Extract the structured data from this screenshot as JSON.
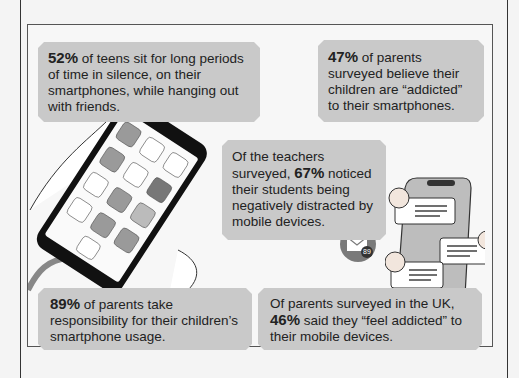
{
  "stats": [
    {
      "id": "teens_silence",
      "pct": "52%",
      "pre": "",
      "post": " of teens sit for long periods of time in silence, on their smartphones, while hanging out with friends."
    },
    {
      "id": "parents_believe_addicted",
      "pct": "47%",
      "pre": "",
      "post": " of parents surveyed believe their children are “addicted” to their smartphones."
    },
    {
      "id": "teachers_distracted",
      "pct": "67%",
      "pre": "Of the teachers surveyed, ",
      "post": " noticed their students being negatively distracted by mobile devices."
    },
    {
      "id": "parents_responsibility",
      "pct": "89%",
      "pre": "",
      "post": " of parents take responsibility for their children’s smartphone usage."
    },
    {
      "id": "uk_parents_addicted",
      "pct": "46%",
      "pre": "Of parents surveyed in the UK, ",
      "post": " said they “feel addicted” to their mobile devices."
    }
  ],
  "illustrations": {
    "phone_in_hand": "smartphone-with-app-icons",
    "chat_phone": "phone-with-chat-bubbles",
    "mail_badge_count": "89"
  },
  "colors": {
    "box_bg": "#c9c9c9",
    "frame_border": "#555555",
    "background": "#f4f4f4",
    "mail_badge": "#7a7a7a"
  }
}
